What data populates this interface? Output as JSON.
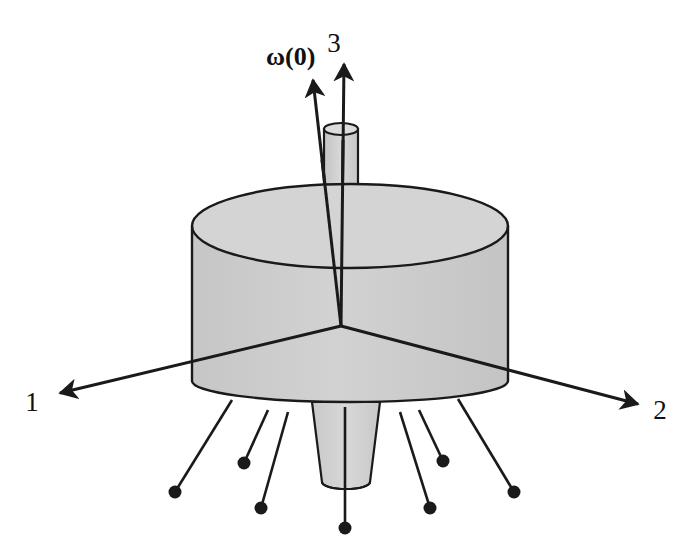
{
  "figure": {
    "background_color": "#ffffff",
    "line_color": "#1a1a1a",
    "body_fill": "#cccccc",
    "body_fill_light": "#d6d6d6",
    "body_fill_dark": "#c2c2c2"
  },
  "labels": {
    "axis_1": "1",
    "axis_2": "2",
    "axis_3": "3",
    "omega": "ω(0)"
  },
  "geometry": {
    "origin": {
      "x": 341,
      "y": 326
    },
    "main_cylinder": {
      "center_x": 350,
      "top_ellipse_cy": 226,
      "bottom_ellipse_cy": 381,
      "rx": 158,
      "ry": 21
    },
    "top_shaft": {
      "center_x": 341,
      "top_cy": 129,
      "bottom_cy": 213,
      "rx": 17,
      "ry": 6
    },
    "bottom_cone": {
      "center_x": 346,
      "top_y": 402,
      "top_rx": 34,
      "bottom_cy": 487,
      "bottom_rx": 24,
      "bottom_ry": 7
    }
  },
  "axes": [
    {
      "name": "axis-3",
      "label": "3",
      "from": {
        "x": 341,
        "y": 326
      },
      "to": {
        "x": 344,
        "y": 58
      },
      "label_pos": {
        "x": 334,
        "y": 50
      }
    },
    {
      "name": "axis-1",
      "label": "1",
      "from": {
        "x": 341,
        "y": 326
      },
      "to": {
        "x": 52,
        "y": 395
      },
      "label_pos": {
        "x": 24,
        "y": 410
      }
    },
    {
      "name": "axis-2",
      "label": "2",
      "from": {
        "x": 341,
        "y": 326
      },
      "to": {
        "x": 645,
        "y": 406
      },
      "label_pos": {
        "x": 655,
        "y": 422
      }
    },
    {
      "name": "omega-vector",
      "label": "ω(0)",
      "from": {
        "x": 341,
        "y": 326
      },
      "to": {
        "x": 312,
        "y": 75
      },
      "label_pos": {
        "x": 262,
        "y": 65
      }
    }
  ],
  "pins": [
    {
      "name": "pin-1",
      "from": {
        "x": 232,
        "y": 400
      },
      "to": {
        "x": 175,
        "y": 492
      }
    },
    {
      "name": "pin-2",
      "from": {
        "x": 268,
        "y": 410
      },
      "to": {
        "x": 244,
        "y": 463
      }
    },
    {
      "name": "pin-3",
      "from": {
        "x": 288,
        "y": 412
      },
      "to": {
        "x": 261,
        "y": 508
      }
    },
    {
      "name": "pin-4",
      "from": {
        "x": 345,
        "y": 412
      },
      "to": {
        "x": 345,
        "y": 528
      }
    },
    {
      "name": "pin-5",
      "from": {
        "x": 400,
        "y": 412
      },
      "to": {
        "x": 430,
        "y": 508
      }
    },
    {
      "name": "pin-6",
      "from": {
        "x": 419,
        "y": 410
      },
      "to": {
        "x": 443,
        "y": 461
      }
    },
    {
      "name": "pin-7",
      "from": {
        "x": 458,
        "y": 399
      },
      "to": {
        "x": 514,
        "y": 492
      }
    }
  ]
}
